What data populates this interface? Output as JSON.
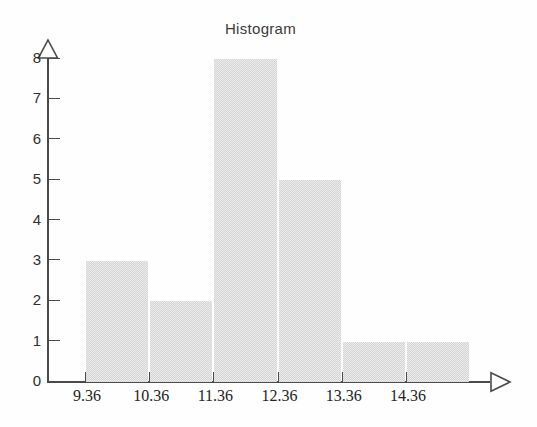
{
  "chart_data": {
    "type": "bar",
    "title": "Histogram",
    "xlabel": "",
    "ylabel": "",
    "categories": [
      "9.36",
      "10.36",
      "11.36",
      "12.36",
      "13.36",
      "14.36"
    ],
    "values": [
      3,
      2,
      8,
      5,
      1,
      1
    ],
    "bins": [
      {
        "left_edge": "9.36",
        "right_edge": "10.36",
        "count": 3
      },
      {
        "left_edge": "10.36",
        "right_edge": "11.36",
        "count": 2
      },
      {
        "left_edge": "11.36",
        "right_edge": "12.36",
        "count": 8
      },
      {
        "left_edge": "12.36",
        "right_edge": "13.36",
        "count": 5
      },
      {
        "left_edge": "13.36",
        "right_edge": "14.36",
        "count": 1
      },
      {
        "left_edge": "14.36",
        "right_edge": "15.36",
        "count": 1
      }
    ],
    "ylim": [
      0,
      8
    ],
    "y_ticks": [
      "0",
      "1",
      "2",
      "3",
      "4",
      "5",
      "6",
      "7",
      "8"
    ],
    "x_ticks": [
      "9.36",
      "10.36",
      "11.36",
      "12.36",
      "13.36",
      "14.36"
    ],
    "grid": false,
    "legend": null,
    "bar_color": "#d4d4d4",
    "axis_color": "#4a4a4a",
    "text_color": "#2f2f2f",
    "background_color": "#fefefe"
  },
  "axes": {
    "y_arrow_label": "y-axis-arrow",
    "x_arrow_label": "x-axis-arrow"
  }
}
